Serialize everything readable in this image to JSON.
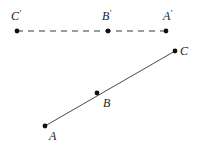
{
  "figure": {
    "background_color": "#ffffff",
    "canvas": {
      "width": 199,
      "height": 146
    }
  },
  "chart_data": {
    "type": "scatter",
    "title": "",
    "xlabel": "",
    "ylabel": "",
    "xlim": [
      0,
      199
    ],
    "ylim": [
      0,
      146
    ],
    "grid": false,
    "legend": "none",
    "series": [
      {
        "name": "image-line",
        "style": "dashed",
        "color": "#3a3a3a",
        "points": [
          {
            "label": "C'",
            "x": 17,
            "y": 31
          },
          {
            "label": "B'",
            "x": 108,
            "y": 31
          },
          {
            "label": "A'",
            "x": 166,
            "y": 31
          }
        ]
      },
      {
        "name": "preimage-line",
        "style": "solid",
        "color": "#4a4a4a",
        "points": [
          {
            "label": "A",
            "x": 45,
            "y": 126
          },
          {
            "label": "B",
            "x": 97,
            "y": 93
          },
          {
            "label": "C",
            "x": 175,
            "y": 51
          }
        ]
      }
    ]
  },
  "labels": {
    "c_prime": "C",
    "c_prime_mark": "′",
    "b_prime": "B",
    "b_prime_mark": "′",
    "a_prime": "A",
    "a_prime_mark": "′",
    "c": "C",
    "b": "B",
    "a": "A"
  },
  "colors": {
    "point": "#111111",
    "dashed_line": "#3a3a3a",
    "solid_line": "#4a4a4a",
    "label_text": "#1a1a1a",
    "background": "#ffffff"
  }
}
